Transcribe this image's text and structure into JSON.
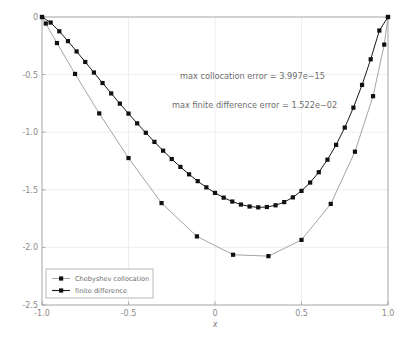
{
  "chart_data": {
    "type": "line",
    "title": "",
    "xlabel": "x",
    "ylabel": "",
    "xlim": [
      -1.0,
      1.0
    ],
    "ylim": [
      -2.5,
      0.0
    ],
    "grid": true,
    "x_ticks": [
      "-1.0",
      "-0.5",
      "0",
      "0.5",
      "1.0"
    ],
    "x_tick_values": [
      -1.0,
      -0.5,
      0,
      0.5,
      1.0
    ],
    "y_ticks": [
      "0",
      "-0.5",
      "-1.0",
      "-1.5",
      "-2.0",
      "-2.5"
    ],
    "y_tick_values": [
      0,
      -0.5,
      -1.0,
      -1.5,
      -2.0,
      -2.5
    ],
    "legend_position": "lower left",
    "series": [
      {
        "name": "Chebyshev collocation",
        "color": "#999999",
        "marker": "square",
        "marker_color": "#101010",
        "x": [
          -1.0,
          -0.9781476,
          -0.9135455,
          -0.809017,
          -0.6691306,
          -0.5,
          -0.309017,
          -0.1045285,
          0.1045285,
          0.309017,
          0.5,
          0.6691306,
          0.809017,
          0.9135455,
          0.9781476,
          1.0
        ],
        "y": [
          0.0,
          -0.0565,
          -0.2262,
          -0.494,
          -0.8369,
          -1.2245,
          -1.6153,
          -1.9045,
          -2.0639,
          -2.0759,
          -1.935,
          -1.6225,
          -1.1692,
          -0.6876,
          -0.2396,
          0.0
        ]
      },
      {
        "name": "finite difference",
        "color": "#1a1a1a",
        "marker": "square",
        "marker_color": "#101010",
        "x": [
          -1.0,
          -0.95,
          -0.9,
          -0.85,
          -0.8,
          -0.75,
          -0.7,
          -0.65,
          -0.6,
          -0.55,
          -0.5,
          -0.45,
          -0.4,
          -0.35,
          -0.3,
          -0.25,
          -0.2,
          -0.15,
          -0.1,
          -0.05,
          0.0,
          0.05,
          0.1,
          0.15,
          0.2,
          0.25,
          0.3,
          0.35,
          0.4,
          0.45,
          0.5,
          0.55,
          0.6,
          0.65,
          0.7,
          0.75,
          0.8,
          0.85,
          0.9,
          0.95,
          1.0
        ],
        "y": [
          0.0,
          -0.0482,
          -0.1242,
          -0.2095,
          -0.299,
          -0.3903,
          -0.482,
          -0.5732,
          -0.6633,
          -0.7518,
          -0.8385,
          -0.923,
          -1.005,
          -1.0842,
          -1.1603,
          -1.2328,
          -1.3014,
          -1.3656,
          -1.4249,
          -1.4788,
          -1.5267,
          -1.568,
          -1.602,
          -1.6279,
          -1.645,
          -1.6524,
          -1.6492,
          -1.6344,
          -1.6069,
          -1.5657,
          -1.5095,
          -1.4371,
          -1.3473,
          -1.2387,
          -1.11,
          -0.9598,
          -0.7868,
          -0.5897,
          -0.3671,
          -0.1176,
          0.0
        ]
      }
    ],
    "annotations": [
      {
        "text": "max collocation error = 3.997e−15",
        "x": 0.07,
        "y": -0.46
      },
      {
        "text": "max finite difference error = 1.522e−02",
        "x": 0.04,
        "y": -0.71
      }
    ]
  },
  "legend": {
    "entries": [
      {
        "label": "Chebyshev collocation"
      },
      {
        "label": "finite difference"
      }
    ]
  }
}
